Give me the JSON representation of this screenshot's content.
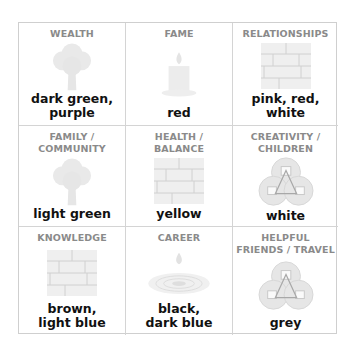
{
  "diagram": {
    "type": "bagua-grid",
    "icon_color": "#e6e6e6",
    "icon_stroke": "#c8c8c8",
    "heading_color": "#8a8a8a",
    "text_color": "#111111",
    "cells": [
      {
        "title": "WEALTH",
        "icon": "tree-icon",
        "colors": "dark green,\npurple"
      },
      {
        "title": "FAME",
        "icon": "candle-icon",
        "colors": "red"
      },
      {
        "title": "RELATIONSHIPS",
        "icon": "brick-wall-icon",
        "colors": "pink, red, white"
      },
      {
        "title": "FAMILY /\nCOMMUNITY",
        "icon": "tree-icon",
        "colors": "light green"
      },
      {
        "title": "HEALTH /\nBALANCE",
        "icon": "brick-wall-icon",
        "colors": "yellow"
      },
      {
        "title": "CREATIVITY /\nCHILDREN",
        "icon": "coins-icon",
        "colors": "white"
      },
      {
        "title": "KNOWLEDGE",
        "icon": "brick-wall-icon",
        "colors": "brown,\nlight blue"
      },
      {
        "title": "CAREER",
        "icon": "water-drop-icon",
        "colors": "black,\ndark blue"
      },
      {
        "title": "HELPFUL\nFRIENDS / TRAVEL",
        "icon": "coins-icon",
        "colors": "grey"
      }
    ]
  }
}
